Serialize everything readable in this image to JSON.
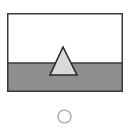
{
  "figure": {
    "frame": {
      "x": 7,
      "y": 13,
      "width": 116,
      "height": 79,
      "stroke": "#3a3a3a"
    },
    "sky": {
      "fill": "#ffffff"
    },
    "ground": {
      "fill": "#8e8e8e",
      "horizon_y_ratio": 0.63
    },
    "triangle": {
      "fill": "#d9d9d9",
      "stroke": "#2a2a2a",
      "shape": "triangle-icon"
    }
  },
  "option": {
    "type": "radio",
    "selected": false,
    "stroke": "#9a9a9a"
  }
}
